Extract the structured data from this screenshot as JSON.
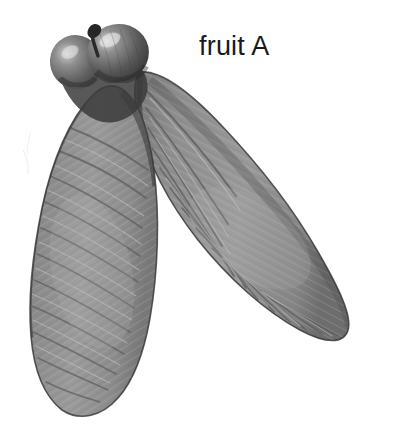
{
  "image": {
    "subject": "maple-samara-pair",
    "background_color": "#ffffff",
    "width": 398,
    "height": 440,
    "style": "grayscale-photograph"
  },
  "label": {
    "text": "fruit A",
    "color": "#1a1a1a",
    "x": 199,
    "y": 33,
    "font_size_px": 27
  },
  "specimen": {
    "name": "samara-pair",
    "parts": [
      {
        "name": "left-seed-body",
        "description": "rounded nutlet, upper left",
        "fill": "#6a6a6a",
        "highlight": "#d6d6d6",
        "cx": 76,
        "cy": 62,
        "rx": 26,
        "ry": 27
      },
      {
        "name": "right-seed-body",
        "description": "rounded nutlet, upper centre",
        "fill": "#5e5e5e",
        "highlight": "#dcdcdc",
        "cx": 118,
        "cy": 53,
        "rx": 30,
        "ry": 29
      },
      {
        "name": "stalk",
        "description": "short dark pedicel between the two nutlets",
        "fill": "#2b2b2b",
        "x": 83,
        "y": 27
      },
      {
        "name": "left-wing",
        "description": "elongate membranous wing angled down-left",
        "fill": "#8d8d8d",
        "edge": "#3c3c3c",
        "vein": "#5d5d5d",
        "tip_x": 62,
        "tip_y": 412
      },
      {
        "name": "right-wing",
        "description": "elongate membranous wing angled down-right",
        "fill": "#8a8a8a",
        "edge": "#3a3a3a",
        "vein": "#5a5a5a",
        "tip_x": 348,
        "tip_y": 318
      },
      {
        "name": "central-gap",
        "description": "white V-shaped background gap separating the wings",
        "fill": "#ffffff"
      }
    ],
    "colors": {
      "wing_fill": "#8b8b8b",
      "wing_fill_light": "#a8a8a8",
      "wing_fill_dark": "#707070",
      "wing_edge": "#3a3a3a",
      "vein": "#595959",
      "vein_light": "#c3c3c3",
      "seed_dark": "#4a4a4a",
      "seed_mid": "#6e6e6e",
      "seed_highlight": "#dedede",
      "background": "#ffffff"
    }
  }
}
